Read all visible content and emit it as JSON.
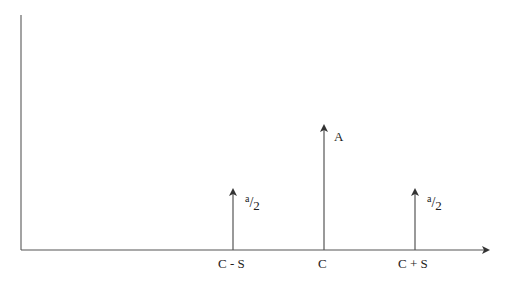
{
  "diagram": {
    "type": "spectrum",
    "axes": {
      "x_arrow": true,
      "y_axis": true
    },
    "lines": [
      {
        "position_label": "C - S",
        "amplitude_label": {
          "num": "a",
          "slash": "/",
          "den": "2"
        }
      },
      {
        "position_label": "C",
        "amplitude_label": "A"
      },
      {
        "position_label": "C + S",
        "amplitude_label": {
          "num": "a",
          "slash": "/",
          "den": "2"
        }
      }
    ]
  },
  "colors": {
    "axis": "#555555",
    "text": "#222222",
    "background": "#ffffff"
  }
}
